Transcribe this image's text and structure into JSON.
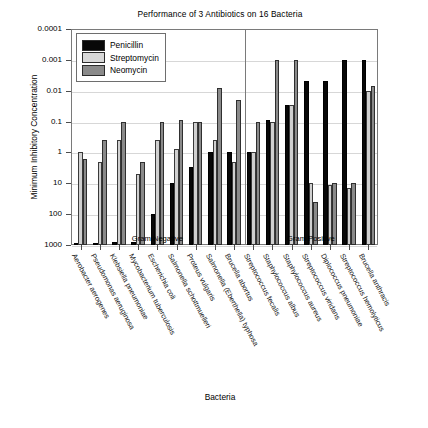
{
  "chart_data": {
    "type": "bar",
    "title": "Performance of 3 Antibiotics on 16 Bacteria",
    "xlabel": "Bacteria",
    "ylabel": "Minimum Inhibitory Concentration",
    "scale": "log-reversed",
    "ylim": [
      0.0001,
      1000
    ],
    "grid": true,
    "legend_position": "top-left",
    "ytick_labels": [
      "0.0001",
      "0.001",
      "0.01",
      "0.1",
      "1",
      "10",
      "100",
      "1000"
    ],
    "ytick_values": [
      0.0001,
      0.001,
      0.01,
      0.1,
      1,
      10,
      100,
      1000
    ],
    "panels": [
      {
        "label": "Gram Negative",
        "count": 9
      },
      {
        "label": "Gram Positive",
        "count": 7
      }
    ],
    "categories": [
      "Aerobacter aerogenes",
      "Pseudomonas aeruginosa",
      "Klebsiella pneumoniae",
      "Mycobacterium tuberculosis",
      "Escherichia coli",
      "Salmonella schottmuelleri",
      "Proteus vulgaris",
      "Salmonella (Eberthella) typhosa",
      "Brucella abortus",
      "Streptococcus fecalis",
      "Staphylococcus albus",
      "Staphylococcus aureus",
      "Streptococcus viridans",
      "Diplococcus pneumoniae",
      "Streptococcus hemolyticus",
      "Brucella anthracis"
    ],
    "series": [
      {
        "name": "Penicillin",
        "color": "#080808",
        "values": [
          870,
          850,
          820,
          800,
          100,
          10,
          3,
          1,
          1,
          1,
          0.09,
          0.03,
          0.005,
          0.005,
          0.001,
          0.001
        ]
      },
      {
        "name": "Streptomycin",
        "color": "#d0d0d0",
        "values": [
          1,
          2,
          0.4,
          5,
          0.4,
          0.8,
          0.1,
          0.4,
          2,
          1,
          0.1,
          0.03,
          10,
          11,
          14,
          0.01
        ]
      },
      {
        "name": "Neomycin",
        "color": "#8a8a8a",
        "values": [
          1.6,
          0.4,
          0.1,
          2,
          0.1,
          0.09,
          0.1,
          0.008,
          0.02,
          0.1,
          0.001,
          0.001,
          40,
          10,
          10,
          0.007
        ]
      }
    ]
  },
  "legend": {
    "items": [
      {
        "label": "Penicillin",
        "swatch": "sw-pen"
      },
      {
        "label": "Streptomycin",
        "swatch": "sw-strep"
      },
      {
        "label": "Neomycin",
        "swatch": "sw-neo"
      }
    ]
  }
}
